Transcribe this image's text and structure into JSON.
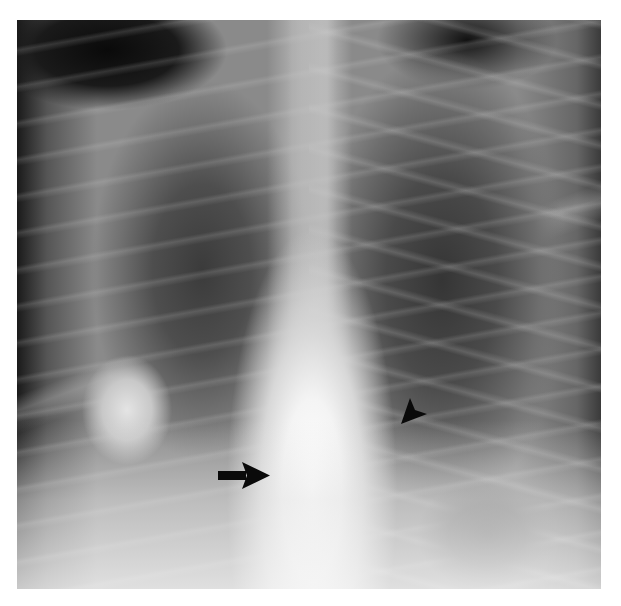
{
  "image": {
    "type": "chest radiograph",
    "view": "frontal",
    "background_color": "#ffffff",
    "frame": {
      "x": 17,
      "y": 20,
      "width": 584,
      "height": 569
    }
  },
  "annotations": [
    {
      "kind": "arrow",
      "direction": "right",
      "color": "#0a0a0a",
      "tail": [
        218,
        475
      ],
      "tip": [
        270,
        475
      ]
    },
    {
      "kind": "arrowhead",
      "direction": "down-left",
      "color": "#0a0a0a",
      "tip": [
        401,
        424
      ],
      "center": [
        414,
        408
      ]
    }
  ]
}
